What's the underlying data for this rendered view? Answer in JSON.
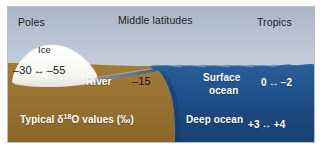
{
  "figure": {
    "name": "oxygen-isotope-hydrologic-cycle-diagram",
    "zones": {
      "poles_label": "Poles",
      "middle_label": "Middle latitudes",
      "tropics_label": "Tropics"
    },
    "ice": {
      "label": "Ice",
      "value_low": "–30",
      "value_arrow": "↔",
      "value_high": "–55"
    },
    "river": {
      "label": "River",
      "value": "–15"
    },
    "surface_ocean": {
      "label_line1": "Surface",
      "label_line2": "ocean",
      "value_low": "0",
      "value_arrow": "↔",
      "value_high": "–2"
    },
    "deep_ocean": {
      "label": "Deep ocean",
      "value_low": "+3",
      "value_arrow": "↔",
      "value_high": "+4"
    },
    "caption": {
      "prefix": "Typical ",
      "delta": "δ",
      "superscript": "18",
      "element": "O",
      "suffix": " values (‰)"
    },
    "colors": {
      "sky_top": "#aab6c8",
      "sky_bottom": "#d6dce4",
      "ocean": "#1f4f86",
      "ocean_deep": "#1b4576",
      "land": "#9a7434",
      "land_dark": "#8a6629",
      "ice": "#fbfbfa",
      "river": "#6e7f92",
      "frame": "#b9bfc9",
      "text_dark": "#1c1c22",
      "text_light": "#ffffff"
    }
  }
}
